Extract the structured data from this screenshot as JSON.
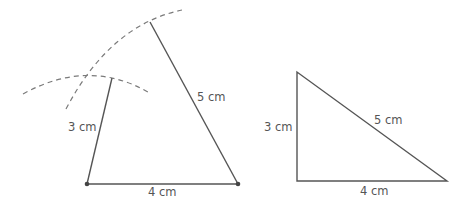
{
  "figures": {
    "construction": {
      "side_left": "3 cm",
      "side_right": "5 cm",
      "side_base": "4 cm"
    },
    "right_triangle": {
      "side_left": "3 cm",
      "side_hyp": "5 cm",
      "side_base": "4 cm"
    }
  },
  "colors": {
    "line": "#555555",
    "arc": "#777777"
  }
}
